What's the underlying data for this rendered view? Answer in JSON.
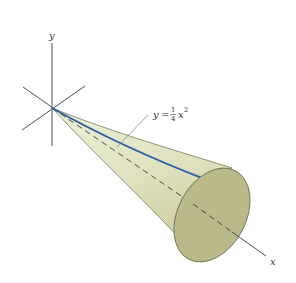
{
  "figure": {
    "type": "solid-of-revolution",
    "axes": {
      "y_label": "y",
      "x_label": "x"
    },
    "curve_label": {
      "lhs": "y",
      "eq": "=",
      "frac_num": "1",
      "frac_den": "4",
      "var": "x",
      "exp": "2"
    },
    "colors": {
      "surface": "#e3e4c6",
      "surface_shade": "#cfd1a6",
      "end_cap": "#b9b98a",
      "curve": "#2a63a5",
      "axis": "#3a3a3a"
    }
  }
}
